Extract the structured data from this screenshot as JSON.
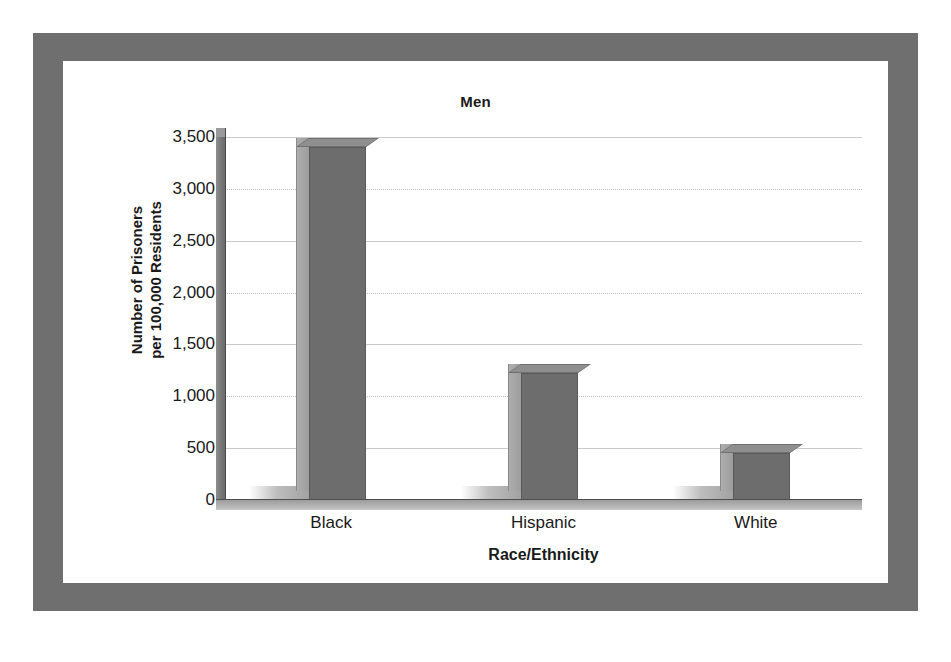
{
  "chart_data": {
    "type": "bar",
    "title": "Men",
    "xlabel": "Race/Ethnicity",
    "ylabel": "Number of Prisoners per 100,000 Residents",
    "ylabel_lines": [
      "Number of Prisoners",
      "per 100,000 Residents"
    ],
    "categories": [
      "Black",
      "Hispanic",
      "White"
    ],
    "values": [
      3400,
      1220,
      450
    ],
    "series": [
      {
        "name": "Men",
        "values": [
          3400,
          1220,
          450
        ]
      }
    ],
    "ylim": [
      0,
      3500
    ],
    "ytick_values": [
      0,
      500,
      1000,
      1500,
      2000,
      2500,
      3000,
      3500
    ],
    "ytick_labels": [
      "0",
      "500",
      "1,000",
      "1,500",
      "2,000",
      "2,500",
      "3,000",
      "3,500"
    ],
    "grid": true,
    "legend": false,
    "legend_position": "none",
    "style": "3d-column",
    "colors": {
      "bar_front": "#6d6d6d",
      "bar_side": "#a5a5a5",
      "bar_top": "#8f8f8f",
      "gridline": "#c9c9c9",
      "frame": "#6f6f6f",
      "floor": "#b4b4b4",
      "text": "#1a1a1a",
      "background": "#ffffff"
    }
  },
  "ytick_items": [
    {
      "label": "3,500"
    },
    {
      "label": "3,000"
    },
    {
      "label": "2,500"
    },
    {
      "label": "2,000"
    },
    {
      "label": "1,500"
    },
    {
      "label": "1,000"
    },
    {
      "label": "500"
    },
    {
      "label": "0"
    }
  ],
  "xtick_items": [
    {
      "label": "Black"
    },
    {
      "label": "Hispanic"
    },
    {
      "label": "White"
    }
  ]
}
